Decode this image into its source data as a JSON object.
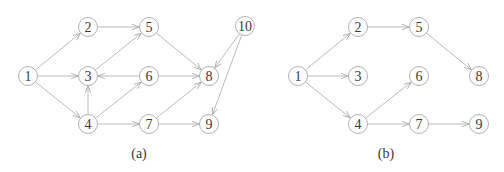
{
  "colors": {
    "edge": "#b4b4b4",
    "node_stroke": "#a8a8a8",
    "text": "#3a3a3a",
    "background": "#ffffff"
  },
  "node_radius": 9.5,
  "graphs": [
    {
      "caption": "(a)",
      "caption_pos": [
        139,
        153
      ],
      "nodes": [
        {
          "id": "1",
          "label": "1",
          "x": 28,
          "y": 76
        },
        {
          "id": "2",
          "label": "2",
          "x": 88,
          "y": 27
        },
        {
          "id": "3",
          "label": "3",
          "x": 88,
          "y": 76
        },
        {
          "id": "4",
          "label": "4",
          "x": 88,
          "y": 124
        },
        {
          "id": "5",
          "label": "5",
          "x": 149,
          "y": 27
        },
        {
          "id": "6",
          "label": "6",
          "x": 149,
          "y": 76
        },
        {
          "id": "7",
          "label": "7",
          "x": 149,
          "y": 124
        },
        {
          "id": "8",
          "label": "8",
          "x": 209,
          "y": 76
        },
        {
          "id": "9",
          "label": "9",
          "x": 209,
          "y": 124
        },
        {
          "id": "10",
          "label": "10",
          "x": 245,
          "y": 26
        }
      ],
      "edges": [
        [
          "1",
          "2"
        ],
        [
          "1",
          "3"
        ],
        [
          "1",
          "4"
        ],
        [
          "2",
          "5"
        ],
        [
          "3",
          "5"
        ],
        [
          "6",
          "3"
        ],
        [
          "4",
          "3"
        ],
        [
          "4",
          "6"
        ],
        [
          "4",
          "7"
        ],
        [
          "5",
          "8"
        ],
        [
          "6",
          "8"
        ],
        [
          "7",
          "8"
        ],
        [
          "7",
          "9"
        ],
        [
          "10",
          "8"
        ],
        [
          "10",
          "9"
        ]
      ]
    },
    {
      "caption": "(b)",
      "caption_pos": [
        386,
        153
      ],
      "nodes": [
        {
          "id": "1",
          "label": "1",
          "x": 298,
          "y": 76
        },
        {
          "id": "2",
          "label": "2",
          "x": 358,
          "y": 27
        },
        {
          "id": "3",
          "label": "3",
          "x": 358,
          "y": 76
        },
        {
          "id": "4",
          "label": "4",
          "x": 358,
          "y": 124
        },
        {
          "id": "5",
          "label": "5",
          "x": 419,
          "y": 27
        },
        {
          "id": "6",
          "label": "6",
          "x": 419,
          "y": 76
        },
        {
          "id": "7",
          "label": "7",
          "x": 419,
          "y": 124
        },
        {
          "id": "8",
          "label": "8",
          "x": 479,
          "y": 76
        },
        {
          "id": "9",
          "label": "9",
          "x": 479,
          "y": 124
        }
      ],
      "edges": [
        [
          "1",
          "2"
        ],
        [
          "1",
          "3"
        ],
        [
          "1",
          "4"
        ],
        [
          "2",
          "5"
        ],
        [
          "5",
          "8"
        ],
        [
          "4",
          "6"
        ],
        [
          "4",
          "7"
        ],
        [
          "7",
          "9"
        ]
      ]
    }
  ]
}
